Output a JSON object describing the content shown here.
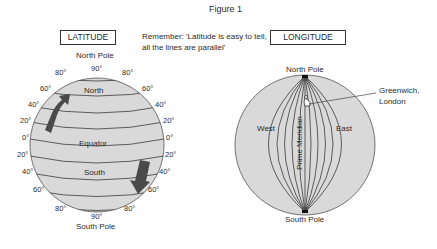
{
  "figure": {
    "title": "Figure 1"
  },
  "latitude": {
    "box_label": "LATITUDE",
    "note": "Remember: 'Latitude is easy to tell, all the lines are parallel'",
    "north_pole": "North Pole",
    "south_pole": "South Pole",
    "region_north": "North",
    "region_south": "South",
    "equator": "Equator",
    "top_degree": "90°",
    "bottom_degree": "90°",
    "left_degrees": [
      "80°",
      "60°",
      "40°",
      "20°",
      "0°",
      "20°",
      "40°",
      "60°",
      "80°"
    ],
    "right_degrees": [
      "80°",
      "60°",
      "40°",
      "20°",
      "0°",
      "20°",
      "40°",
      "60°",
      "80°"
    ],
    "colors": {
      "globe_fill": "#d9d9d9",
      "line": "#3a3a3a",
      "arrow": "#4a4a4a"
    }
  },
  "longitude": {
    "box_label": "LONGITUDE",
    "north_pole": "North Pole",
    "south_pole": "South Pole",
    "west": "West",
    "east": "East",
    "prime_meridian": "Prime Meridian",
    "greenwich": [
      "Greenwich,",
      "London"
    ],
    "colors": {
      "globe_fill": "#d9d9d9",
      "line": "#3a3a3a"
    }
  }
}
